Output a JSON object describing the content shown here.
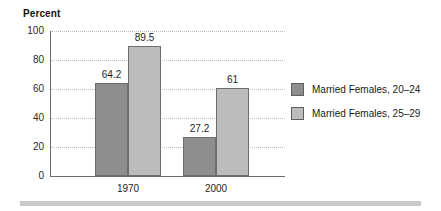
{
  "chart_data": {
    "type": "bar",
    "title": "",
    "ylabel": "Percent",
    "xlabel": "",
    "categories": [
      "1970",
      "2000"
    ],
    "series": [
      {
        "name": "Married Females, 20–24",
        "color": "#8e8e8e",
        "values": [
          64.2,
          27.2
        ],
        "labels": [
          "64.2",
          "27.2"
        ]
      },
      {
        "name": "Married Females, 25–29",
        "color": "#bcbcbc",
        "values": [
          89.5,
          61
        ],
        "labels": [
          "89.5",
          "61"
        ]
      }
    ],
    "ylim": [
      0,
      100
    ],
    "y_ticks": [
      "100",
      "80",
      "60",
      "40",
      "20",
      "0"
    ],
    "y_tick_values": [
      100,
      80,
      60,
      40,
      20,
      0
    ],
    "grid": true,
    "legend_position": "right"
  },
  "legend": {
    "items": [
      {
        "label": "Married Females, 20–24"
      },
      {
        "label": "Married Females, 25–29"
      }
    ]
  }
}
